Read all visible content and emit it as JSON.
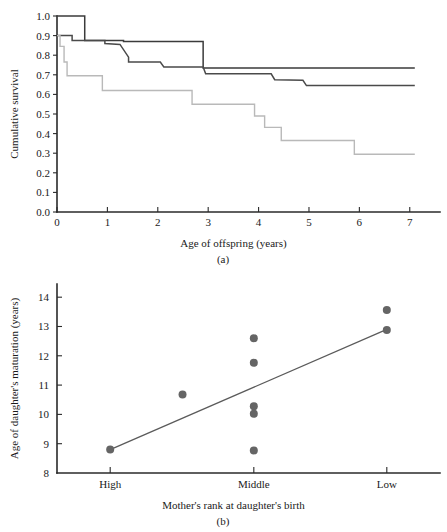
{
  "figure": {
    "panel_a_letter": "(a)",
    "panel_b_letter": "(b)"
  },
  "chart_data": [
    {
      "type": "line",
      "id": "panel-a",
      "title": "",
      "xlabel": "Age of offspring (years)",
      "ylabel": "Cumulative survival",
      "xlim": [
        0,
        7.6
      ],
      "ylim": [
        0.0,
        1.0
      ],
      "xticks": [
        0,
        1,
        2,
        3,
        4,
        5,
        6,
        7
      ],
      "xticklabels": [
        "0",
        "1",
        "2",
        "3",
        "4",
        "5",
        "6",
        "7"
      ],
      "yticks": [
        0.0,
        0.1,
        0.2,
        0.3,
        0.4,
        0.5,
        0.6,
        0.7,
        0.8,
        0.9,
        1.0
      ],
      "yticklabels": [
        "0.0",
        "0.1",
        "0.2",
        "0.3",
        "0.4",
        "0.5",
        "0.6",
        "0.7",
        "0.8",
        "0.9",
        "1.0"
      ],
      "grid": false,
      "legend": "none",
      "step_style": "post",
      "series": [
        {
          "name": "curve-high-rank",
          "color": "#3b3b3b",
          "points": [
            [
              0.0,
              1.0
            ],
            [
              0.12,
              1.0
            ],
            [
              0.12,
              1.0
            ],
            [
              0.55,
              1.0
            ],
            [
              0.55,
              0.875
            ],
            [
              1.32,
              0.875
            ],
            [
              1.32,
              0.87
            ],
            [
              2.9,
              0.87
            ],
            [
              2.9,
              0.735
            ],
            [
              7.1,
              0.735
            ]
          ]
        },
        {
          "name": "curve-middle-rank",
          "color": "#4a4a4a",
          "points": [
            [
              0.0,
              0.9
            ],
            [
              0.3,
              0.9
            ],
            [
              0.3,
              0.875
            ],
            [
              0.95,
              0.875
            ],
            [
              0.95,
              0.86
            ],
            [
              1.25,
              0.855
            ],
            [
              1.42,
              0.79
            ],
            [
              1.42,
              0.765
            ],
            [
              2.05,
              0.765
            ],
            [
              2.12,
              0.74
            ],
            [
              2.9,
              0.74
            ],
            [
              2.95,
              0.705
            ],
            [
              4.25,
              0.705
            ],
            [
              4.32,
              0.675
            ],
            [
              4.88,
              0.672
            ],
            [
              4.95,
              0.645
            ],
            [
              7.1,
              0.645
            ]
          ]
        },
        {
          "name": "curve-low-rank",
          "color": "#b9b9b9",
          "points": [
            [
              0.0,
              0.9
            ],
            [
              0.06,
              0.9
            ],
            [
              0.06,
              0.845
            ],
            [
              0.14,
              0.845
            ],
            [
              0.14,
              0.765
            ],
            [
              0.2,
              0.765
            ],
            [
              0.2,
              0.695
            ],
            [
              0.9,
              0.695
            ],
            [
              0.9,
              0.62
            ],
            [
              2.68,
              0.62
            ],
            [
              2.68,
              0.55
            ],
            [
              3.92,
              0.55
            ],
            [
              3.92,
              0.49
            ],
            [
              4.12,
              0.49
            ],
            [
              4.12,
              0.432
            ],
            [
              4.45,
              0.432
            ],
            [
              4.45,
              0.365
            ],
            [
              5.9,
              0.365
            ],
            [
              5.9,
              0.295
            ],
            [
              7.1,
              0.295
            ]
          ]
        }
      ]
    },
    {
      "type": "scatter",
      "id": "panel-b",
      "title": "",
      "xlabel": "Mother's rank at daughter's birth",
      "ylabel": "Age of daughter's maturation (years)",
      "xlim": [
        0,
        3.6
      ],
      "ylim": [
        8,
        14.45
      ],
      "categories": [
        "High",
        "Middle",
        "Low"
      ],
      "xticks": [
        0.5,
        1.85,
        3.1
      ],
      "yticks": [
        8,
        9,
        10,
        11,
        12,
        13,
        14
      ],
      "yticklabels": [
        "8",
        "9",
        "10",
        "11",
        "12",
        "13",
        "14"
      ],
      "grid": false,
      "legend": "none",
      "points": [
        {
          "x": 0.5,
          "y": 8.8,
          "category": "High"
        },
        {
          "x": 1.18,
          "y": 10.68,
          "category": "High-Middle"
        },
        {
          "x": 1.85,
          "y": 12.6,
          "category": "Middle"
        },
        {
          "x": 1.85,
          "y": 11.76,
          "category": "Middle"
        },
        {
          "x": 1.85,
          "y": 10.28,
          "category": "Middle"
        },
        {
          "x": 1.85,
          "y": 10.02,
          "category": "Middle"
        },
        {
          "x": 1.85,
          "y": 8.77,
          "category": "Middle"
        },
        {
          "x": 3.1,
          "y": 13.56,
          "category": "Low"
        },
        {
          "x": 3.1,
          "y": 12.88,
          "category": "Low"
        }
      ],
      "regression_line": {
        "name": "regression-line",
        "x": [
          0.5,
          3.1
        ],
        "y": [
          8.8,
          12.9
        ],
        "color": "#5b5b5b"
      }
    }
  ]
}
